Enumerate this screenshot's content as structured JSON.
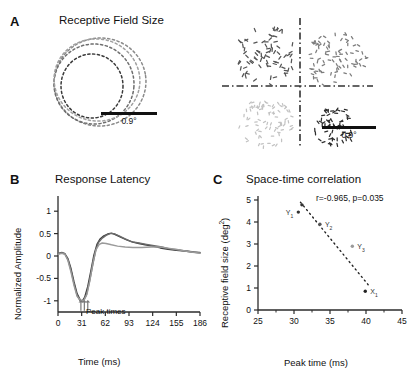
{
  "figure": {
    "panels": [
      {
        "letter": "A",
        "title": "Receptive Field Size"
      },
      {
        "letter": "B",
        "title": "Response Latency"
      },
      {
        "letter": "C",
        "title": "Space-time correlation"
      }
    ]
  },
  "panelA": {
    "letter": "A",
    "title": "Receptive Field Size",
    "left": {
      "scalebar_label": "0.9°",
      "contours": [
        {
          "name": "contour-outer",
          "cx": 66,
          "cy": 60,
          "rx": 46,
          "ry": 44,
          "rot": -8,
          "gray": "#8a8a8a"
        },
        {
          "name": "contour-middle",
          "cx": 60,
          "cy": 62,
          "rx": 40,
          "ry": 40,
          "rot": 4,
          "gray": "#6e6e6e"
        },
        {
          "name": "contour-inner",
          "cx": 58,
          "cy": 64,
          "rx": 31,
          "ry": 32,
          "rot": 0,
          "gray": "#3a3a3a"
        },
        {
          "name": "contour-innermost",
          "cx": 63,
          "cy": 58,
          "rx": 43,
          "ry": 41,
          "rot": 14,
          "gray": "#a0a0a0"
        }
      ]
    },
    "right": {
      "scalebar_label": "0.9°",
      "axis_style": "dash-dot",
      "blobs": [
        {
          "name": "blob-upper-left",
          "cx": 48,
          "cy": 42,
          "r": 31,
          "dots": 78,
          "gray": "#555555",
          "dash_len": 3.4
        },
        {
          "name": "blob-upper-right",
          "cx": 119,
          "cy": 46,
          "r": 30,
          "dots": 86,
          "gray": "#7d7d7d",
          "dash_len": 2.6
        },
        {
          "name": "blob-lower-left",
          "cx": 48,
          "cy": 109,
          "r": 27,
          "dots": 80,
          "gray": "#c2c2c2",
          "dash_len": 2.4
        },
        {
          "name": "blob-lower-right",
          "cx": 117,
          "cy": 113,
          "r": 21,
          "dots": 62,
          "gray": "#2e2e2e",
          "dash_len": 3.0
        }
      ]
    }
  },
  "panelB": {
    "letter": "B",
    "title": "Response Latency",
    "xlabel": "Time (ms)",
    "ylabel": "Normalized Amplitude",
    "xticks": [
      0,
      31,
      62,
      93,
      124,
      155,
      186
    ],
    "yticks": [
      1,
      0.5,
      0,
      -0.5,
      -1
    ],
    "xlim": [
      0,
      186
    ],
    "ylim": [
      -1.25,
      1.25
    ],
    "annotation": "Peak times",
    "peak_markers": [
      30,
      34.5,
      39
    ],
    "curves": [
      {
        "name": "curve-1",
        "gray": "#3d3d3d",
        "width": 1.4,
        "points": [
          [
            0,
            0.05
          ],
          [
            5,
            0.07
          ],
          [
            9,
            0.05
          ],
          [
            13,
            -0.06
          ],
          [
            17,
            -0.28
          ],
          [
            21,
            -0.58
          ],
          [
            25,
            -0.84
          ],
          [
            29,
            -0.98
          ],
          [
            32,
            -1.0
          ],
          [
            35,
            -0.92
          ],
          [
            39,
            -0.68
          ],
          [
            43,
            -0.34
          ],
          [
            47,
            0.02
          ],
          [
            51,
            0.26
          ],
          [
            55,
            0.38
          ],
          [
            60,
            0.45
          ],
          [
            65,
            0.49
          ],
          [
            70,
            0.51
          ],
          [
            75,
            0.48
          ],
          [
            82,
            0.42
          ],
          [
            90,
            0.36
          ],
          [
            98,
            0.31
          ],
          [
            106,
            0.28
          ],
          [
            114,
            0.25
          ],
          [
            124,
            0.22
          ],
          [
            134,
            0.18
          ],
          [
            144,
            0.15
          ],
          [
            155,
            0.13
          ],
          [
            166,
            0.11
          ],
          [
            176,
            0.09
          ],
          [
            186,
            0.07
          ]
        ]
      },
      {
        "name": "curve-2",
        "gray": "#6b6b6b",
        "width": 1.4,
        "points": [
          [
            0,
            0.06
          ],
          [
            5,
            0.08
          ],
          [
            9,
            0.05
          ],
          [
            13,
            -0.08
          ],
          [
            17,
            -0.32
          ],
          [
            21,
            -0.62
          ],
          [
            25,
            -0.88
          ],
          [
            29,
            -1.0
          ],
          [
            33,
            -1.0
          ],
          [
            37,
            -0.88
          ],
          [
            41,
            -0.6
          ],
          [
            45,
            -0.24
          ],
          [
            49,
            0.1
          ],
          [
            53,
            0.3
          ],
          [
            58,
            0.4
          ],
          [
            63,
            0.46
          ],
          [
            68,
            0.5
          ],
          [
            73,
            0.5
          ],
          [
            80,
            0.45
          ],
          [
            88,
            0.38
          ],
          [
            96,
            0.32
          ],
          [
            106,
            0.29
          ],
          [
            116,
            0.26
          ],
          [
            126,
            0.23
          ],
          [
            136,
            0.2
          ],
          [
            146,
            0.16
          ],
          [
            156,
            0.14
          ],
          [
            168,
            0.11
          ],
          [
            178,
            0.09
          ],
          [
            186,
            0.08
          ]
        ]
      },
      {
        "name": "curve-3",
        "gray": "#9a9a9a",
        "width": 1.4,
        "points": [
          [
            0,
            0.04
          ],
          [
            5,
            0.06
          ],
          [
            9,
            0.04
          ],
          [
            13,
            -0.1
          ],
          [
            17,
            -0.36
          ],
          [
            21,
            -0.66
          ],
          [
            25,
            -0.9
          ],
          [
            30,
            -1.0
          ],
          [
            34,
            -0.99
          ],
          [
            38,
            -0.85
          ],
          [
            42,
            -0.52
          ],
          [
            46,
            -0.14
          ],
          [
            50,
            0.15
          ],
          [
            54,
            0.26
          ],
          [
            58,
            0.29
          ],
          [
            63,
            0.28
          ],
          [
            70,
            0.25
          ],
          [
            78,
            0.22
          ],
          [
            88,
            0.2
          ],
          [
            98,
            0.19
          ],
          [
            110,
            0.19
          ],
          [
            122,
            0.2
          ],
          [
            134,
            0.2
          ],
          [
            146,
            0.17
          ],
          [
            158,
            0.14
          ],
          [
            170,
            0.1
          ],
          [
            186,
            0.06
          ]
        ]
      }
    ]
  },
  "panelC": {
    "letter": "C",
    "title": "Space-time correlation",
    "xlabel": "Peak time (ms)",
    "ylabel": "Receptive field size (deg²)",
    "ylabel_base": "Receptive field size (deg",
    "ylabel_sup": "2",
    "ylabel_close": ")",
    "xticks": [
      25,
      30,
      35,
      40,
      45
    ],
    "yticks": [
      0,
      1,
      2,
      3,
      4,
      5
    ],
    "xlim": [
      25,
      45
    ],
    "ylim": [
      0,
      5
    ],
    "correlation_text": "r=-0.965, p=0.035",
    "r": -0.965,
    "p": 0.035,
    "points": [
      {
        "name": "point-y1",
        "x": 30.6,
        "y": 4.45,
        "label": "Y",
        "sub": "1",
        "label_side": "left",
        "gray": "#333333"
      },
      {
        "name": "point-y2",
        "x": 31.1,
        "y": 4.78,
        "label": "",
        "sub": "",
        "label_side": "none",
        "gray": "#333333"
      },
      {
        "name": "point-y3",
        "x": 33.6,
        "y": 3.9,
        "label": "Y",
        "sub": "2",
        "label_side": "right",
        "gray": "#555555"
      },
      {
        "name": "point-y4",
        "x": 38.1,
        "y": 2.9,
        "label": "Y",
        "sub": "3",
        "label_side": "right",
        "gray": "#9a9a9a"
      },
      {
        "name": "point-x1",
        "x": 39.9,
        "y": 0.85,
        "label": "X",
        "sub": "1",
        "label_side": "right",
        "gray": "#222222"
      }
    ],
    "fit_line": {
      "name": "regression-line",
      "style": "dotted",
      "x1": 30.9,
      "y1": 4.9,
      "x2": 40.3,
      "y2": 1.15
    }
  }
}
